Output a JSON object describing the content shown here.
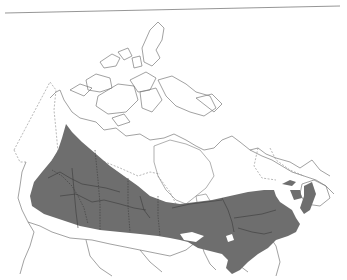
{
  "map": {
    "subject": "Range map of Canada",
    "range_fill_color": "#6e6e6e",
    "outline_color": "#7a7a7a",
    "background_color": "#ffffff",
    "top_rule": true,
    "regions_shaded": [
      "British Columbia (southern/central)",
      "Alberta",
      "Saskatchewan (southern)",
      "Manitoba (southern)",
      "Ontario (southern/central)",
      "Quebec (southern)",
      "New Brunswick",
      "Nova Scotia",
      "Prince Edward Island"
    ],
    "labels": []
  }
}
